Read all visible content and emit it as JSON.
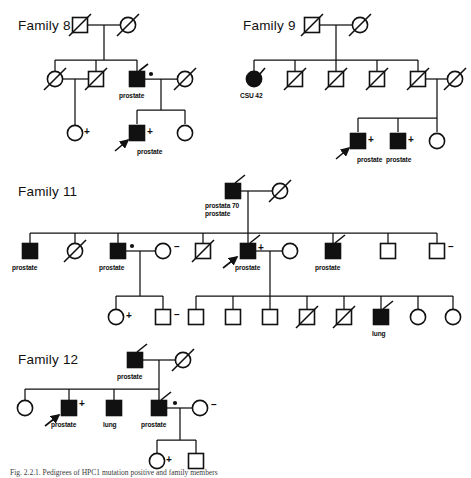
{
  "figure": {
    "caption": "Fig. 2.2.1. Pedigrees of HPC1 mutation positive and family members",
    "type": "pedigree-chart",
    "legend": {
      "filled_square": "affected male",
      "open_square": "unaffected male",
      "filled_circle": "affected female",
      "open_circle": "unaffected female",
      "slash": "deceased",
      "arrow": "proband",
      "dot": "obligate carrier",
      "plus": "mutation carrier",
      "minus": "non-carrier"
    },
    "colors": {
      "stroke": "#111111",
      "fill_affected": "#111111",
      "fill_unaffected": "#ffffff",
      "background": "#ffffff"
    }
  },
  "families": [
    {
      "id": "family-8",
      "title": "Family 8",
      "labels": [
        "prostate",
        "prostate"
      ],
      "symbols": [
        "+",
        "+",
        "+"
      ]
    },
    {
      "id": "family-9",
      "title": "Family 9",
      "labels": [
        "CSU 42",
        "prostate",
        "prostate"
      ],
      "symbols": [
        "+",
        "+"
      ]
    },
    {
      "id": "family-11",
      "title": "Family 11",
      "labels": [
        "prostata 70",
        "prostate",
        "prostate",
        "prostate",
        "prostate",
        "prostate",
        "lung"
      ],
      "symbols": [
        "–",
        "+",
        "–",
        "+",
        "–"
      ]
    },
    {
      "id": "family-12",
      "title": "Family 12",
      "labels": [
        "prostate",
        "prostate",
        "lung",
        "prostate"
      ],
      "symbols": [
        "+",
        "–",
        "+"
      ]
    }
  ],
  "text": {
    "family8_title": "Family 8",
    "family9_title": "Family 9",
    "family11_title": "Family 11",
    "family12_title": "Family 12",
    "prostate": "prostate",
    "prostata70": "prostata 70",
    "lung": "lung",
    "csu42": "CSU 42",
    "plus": "+",
    "minus": "–"
  }
}
